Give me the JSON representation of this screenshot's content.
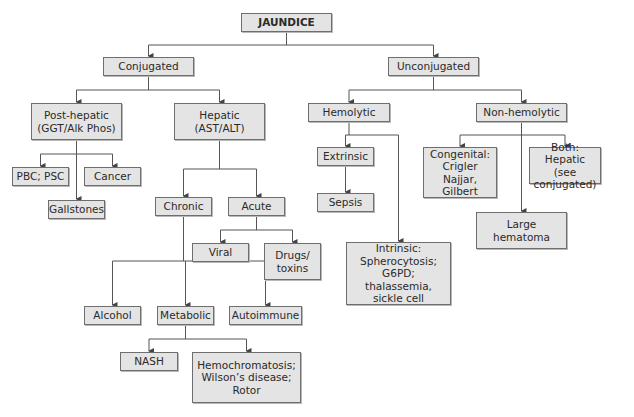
{
  "diagram": {
    "title": "JAUNDICE",
    "colors": {
      "box_fill": "#e4e4e4",
      "box_border": "#6e6e6e",
      "line": "#555555",
      "text": "#2a2a2a"
    },
    "nodes": [
      {
        "id": "jaundice",
        "label": "JAUNDICE",
        "x": 241,
        "y": 13,
        "w": 91,
        "h": 19
      },
      {
        "id": "conjugated",
        "label": "Conjugated",
        "x": 103,
        "y": 57,
        "w": 91,
        "h": 19
      },
      {
        "id": "unconjugated",
        "label": "Unconjugated",
        "x": 388,
        "y": 57,
        "w": 91,
        "h": 19
      },
      {
        "id": "post_hepatic",
        "label": "Post-hepatic\n(GGT/Alk Phos)",
        "x": 31,
        "y": 103,
        "w": 91,
        "h": 37
      },
      {
        "id": "hepatic",
        "label": "Hepatic\n(AST/ALT)",
        "x": 174,
        "y": 103,
        "w": 91,
        "h": 37
      },
      {
        "id": "hemolytic",
        "label": "Hemolytic",
        "x": 308,
        "y": 103,
        "w": 82,
        "h": 19
      },
      {
        "id": "non_hemolytic",
        "label": "Non-hemolytic",
        "x": 476,
        "y": 103,
        "w": 91,
        "h": 19
      },
      {
        "id": "pbc_psc",
        "label": "PBC; PSC",
        "x": 12,
        "y": 167,
        "w": 57,
        "h": 19
      },
      {
        "id": "cancer",
        "label": "Cancer",
        "x": 84,
        "y": 167,
        "w": 57,
        "h": 19
      },
      {
        "id": "gallstones",
        "label": "Gallstones",
        "x": 48,
        "y": 200,
        "w": 57,
        "h": 19
      },
      {
        "id": "chronic",
        "label": "Chronic",
        "x": 155,
        "y": 197,
        "w": 57,
        "h": 19
      },
      {
        "id": "acute",
        "label": "Acute",
        "x": 228,
        "y": 197,
        "w": 57,
        "h": 19
      },
      {
        "id": "viral",
        "label": "Viral",
        "x": 192,
        "y": 243,
        "w": 57,
        "h": 19
      },
      {
        "id": "drugs_toxins",
        "label": "Drugs/\ntoxins",
        "x": 264,
        "y": 243,
        "w": 57,
        "h": 37
      },
      {
        "id": "extrinsic",
        "label": "Extrinsic",
        "x": 317,
        "y": 147,
        "w": 57,
        "h": 19
      },
      {
        "id": "sepsis",
        "label": "Sepsis",
        "x": 317,
        "y": 193,
        "w": 57,
        "h": 19
      },
      {
        "id": "congenital",
        "label": "Congenital:\nCrigler Najjar,\nGilbert",
        "x": 423,
        "y": 147,
        "w": 74,
        "h": 51
      },
      {
        "id": "both_hepatic",
        "label": "Both: Hepatic\n(see conjugated)",
        "x": 529,
        "y": 147,
        "w": 72,
        "h": 37
      },
      {
        "id": "large_hematoma",
        "label": "Large\nhematoma",
        "x": 476,
        "y": 212,
        "w": 91,
        "h": 37
      },
      {
        "id": "intrinsic",
        "label": "Intrinsic:\nSpherocytosis;\nG6PD; thalassemia,\nsickle cell",
        "x": 346,
        "y": 242,
        "w": 105,
        "h": 63
      },
      {
        "id": "alcohol",
        "label": "Alcohol",
        "x": 84,
        "y": 306,
        "w": 57,
        "h": 19
      },
      {
        "id": "metabolic",
        "label": "Metabolic",
        "x": 157,
        "y": 306,
        "w": 57,
        "h": 19
      },
      {
        "id": "autoimmune",
        "label": "Autoimmune",
        "x": 229,
        "y": 306,
        "w": 73,
        "h": 19
      },
      {
        "id": "nash",
        "label": "NASH",
        "x": 120,
        "y": 352,
        "w": 58,
        "h": 19
      },
      {
        "id": "hemochromatosis",
        "label": "Hemochromatosis;\nWilson’s disease;\nRotor",
        "x": 192,
        "y": 352,
        "w": 109,
        "h": 51
      }
    ],
    "edges": [
      {
        "from": "jaundice",
        "to": [
          "conjugated",
          "unconjugated"
        ]
      },
      {
        "from": "conjugated",
        "to": [
          "post_hepatic",
          "hepatic"
        ]
      },
      {
        "from": "unconjugated",
        "to": [
          "hemolytic",
          "non_hemolytic"
        ]
      },
      {
        "from": "post_hepatic",
        "to": [
          "pbc_psc",
          "cancer",
          "gallstones"
        ]
      },
      {
        "from": "hepatic",
        "to": [
          "chronic",
          "acute"
        ]
      },
      {
        "from": "acute",
        "to": [
          "viral",
          "drugs_toxins"
        ]
      },
      {
        "from": "chronic",
        "to": [
          "alcohol",
          "metabolic",
          "autoimmune"
        ]
      },
      {
        "from": "metabolic",
        "to": [
          "nash",
          "hemochromatosis"
        ]
      },
      {
        "from": "hemolytic",
        "to": [
          "extrinsic",
          "intrinsic"
        ]
      },
      {
        "from": "extrinsic",
        "to": [
          "sepsis"
        ]
      },
      {
        "from": "non_hemolytic",
        "to": [
          "congenital",
          "both_hepatic",
          "large_hematoma"
        ]
      }
    ]
  }
}
